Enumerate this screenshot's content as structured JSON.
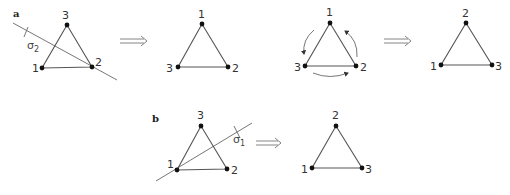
{
  "panels": {
    "a": {
      "label": "a",
      "operation": {
        "symbol": "σ",
        "subscript": "2"
      },
      "triangles": [
        {
          "top": "3",
          "left": "1",
          "right": "2"
        },
        {
          "top": "1",
          "left": "3",
          "right": "2"
        },
        {
          "top": "1",
          "left": "3",
          "right": "2",
          "rotation_arrows": true
        },
        {
          "top": "2",
          "left": "1",
          "right": "3"
        }
      ]
    },
    "b": {
      "label": "b",
      "operation": {
        "symbol": "σ",
        "subscript": "1"
      },
      "triangles": [
        {
          "top": "3",
          "left": "1",
          "right": "2"
        },
        {
          "top": "2",
          "left": "1",
          "right": "3"
        }
      ]
    }
  },
  "implies_symbol": "⟹"
}
